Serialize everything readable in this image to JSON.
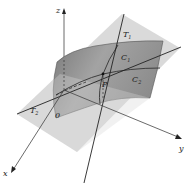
{
  "figure": {
    "axes": {
      "x": "x",
      "y": "y",
      "z": "z",
      "origin": "0"
    },
    "labels": {
      "point": "P",
      "curve1": "C",
      "curve1_sub": "1",
      "curve2": "C",
      "curve2_sub": "2",
      "tangent1": "T",
      "tangent1_sub": "1",
      "tangent2": "T",
      "tangent2_sub": "2"
    },
    "colors": {
      "plane": "#d6d6d6",
      "surface_light": "#9a9a9a",
      "surface_dark": "#6a6a6a",
      "line": "#2a2a2a",
      "axis": "#333333"
    }
  }
}
